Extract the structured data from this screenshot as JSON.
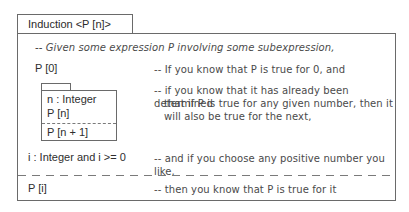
{
  "diagram": {
    "title": "Induction <P [n]>",
    "intro_note": "-- Given some expression P involving some subexpression,",
    "rows": [
      {
        "expression": "P [0]",
        "note": "-- If you know that P is true for 0, and"
      },
      {
        "nested_block": {
          "declarations": [
            "n : Integer",
            "P [n]"
          ],
          "conclusion": "P [n + 1]"
        },
        "note_lines": [
          "-- if you know that it has already been determined",
          "that if P is true for any given number, then it",
          "will also be true for the next,"
        ]
      },
      {
        "expression": "i : Integer and i >= 0",
        "note": "-- and if you choose any positive number you like,"
      }
    ],
    "conclusion": {
      "expression": "P [i]",
      "note": "-- then you know that P is true for it"
    }
  }
}
